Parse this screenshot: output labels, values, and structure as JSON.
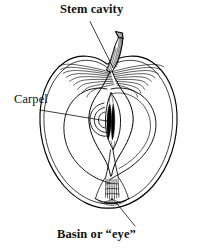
{
  "figure": {
    "type": "labeled-anatomical-diagram",
    "background_color": "#ffffff",
    "ink_color": "#000000",
    "labels": [
      {
        "id": "stem-cavity",
        "text": "Stem cavity",
        "weight": "bold",
        "leader_from": [
          90,
          22
        ],
        "leader_to": [
          113,
          68
        ]
      },
      {
        "id": "carpel",
        "text": "Carpel",
        "weight": "normal",
        "leader_from": [
          40,
          110
        ],
        "leader_to": [
          113,
          122
        ]
      },
      {
        "id": "basin",
        "text": "Basin or “eye”",
        "weight": "bold",
        "leader_from": [
          135,
          226
        ],
        "leader_to": [
          116,
          203
        ]
      }
    ],
    "parts": [
      "stem",
      "stem cavity",
      "skin outline",
      "flesh",
      "core",
      "carpel",
      "seeds",
      "calyx tube",
      "basin or eye"
    ]
  }
}
